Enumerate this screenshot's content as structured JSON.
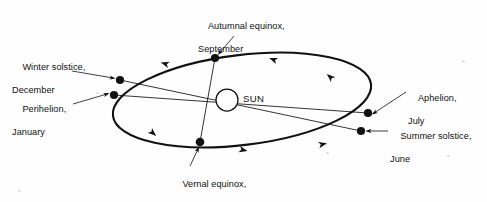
{
  "figure": {
    "kind": "astronomy-orbit-diagram",
    "background_color": "#fefefe",
    "ink_color": "#111111",
    "width": 487,
    "height": 202
  },
  "sun": {
    "label": "SUN",
    "cx": 227,
    "cy": 100,
    "r": 11,
    "fill": "#ffffff",
    "stroke": "#111111"
  },
  "orbit": {
    "shape": "ellipse",
    "cx": 242,
    "cy": 100,
    "rx": 130,
    "ry": 45,
    "rotation_deg": -7,
    "stroke": "#111111",
    "stroke_width": 2.1,
    "direction_note": "arrowheads: bottom arc points right, top arc points left"
  },
  "points": [
    {
      "id": "autumnal-equinox",
      "label_line1": "Autumnal equinox,",
      "label_line2": "September",
      "dot": {
        "x": 215,
        "y": 58
      },
      "label_pos": {
        "x": 198,
        "y": 10
      }
    },
    {
      "id": "winter-solstice",
      "label_line1": "Winter solstice,",
      "label_line2": "December",
      "dot": {
        "x": 120,
        "y": 80
      },
      "label_pos": {
        "x": 12,
        "y": 51
      }
    },
    {
      "id": "perihelion",
      "label_line1": "Perihelion,",
      "label_line2": "January",
      "dot": {
        "x": 114,
        "y": 95
      },
      "label_pos": {
        "x": 12,
        "y": 93
      }
    },
    {
      "id": "vernal-equinox",
      "label_line1": "Vernal equinox,",
      "label_line2": "March",
      "dot": {
        "x": 200,
        "y": 142
      },
      "label_pos": {
        "x": 172,
        "y": 168
      }
    },
    {
      "id": "aphelion",
      "label_line1": "Aphelion,",
      "label_line2": "July",
      "dot": {
        "x": 368,
        "y": 113
      },
      "label_pos": {
        "x": 408,
        "y": 82
      }
    },
    {
      "id": "summer-solstice",
      "label_line1": "Summer solstice,",
      "label_line2": "June",
      "dot": {
        "x": 361,
        "y": 131
      },
      "label_pos": {
        "x": 390,
        "y": 120
      }
    }
  ],
  "axes": [
    {
      "id": "solstice-line",
      "from": "winter-solstice",
      "to": "summer-solstice"
    },
    {
      "id": "apsidal-line",
      "from": "perihelion",
      "to": "aphelion"
    },
    {
      "id": "equinox-line",
      "from": "autumnal-equinox",
      "to": "vernal-equinox"
    }
  ]
}
